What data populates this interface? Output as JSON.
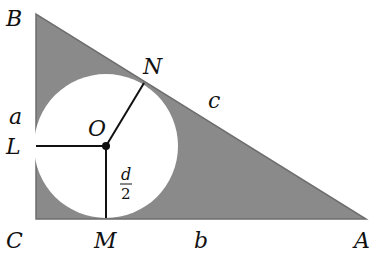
{
  "diagram": {
    "colors": {
      "fill": "#8a8a8a",
      "edge": "#6e6e6e",
      "circle": "#ffffff",
      "line": "#111111"
    },
    "vertices": {
      "B": "B",
      "C": "C",
      "A": "A"
    },
    "tangent_points": {
      "N": "N",
      "L": "L",
      "M": "M"
    },
    "center": "O",
    "sides": {
      "a": "a",
      "b": "b",
      "c": "c"
    },
    "radius_label": {
      "numerator": "d",
      "denominator": "2"
    }
  }
}
